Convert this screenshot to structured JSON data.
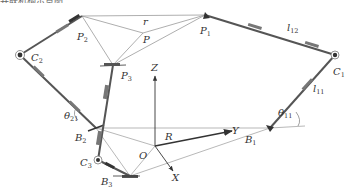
{
  "figure": {
    "caption_fragment": "并联机构示意图",
    "labels": {
      "r": "r",
      "P": "P",
      "P1": "P",
      "P1_sub": "1",
      "P2": "P",
      "P2_sub": "2",
      "P3": "P",
      "P3_sub": "3",
      "C1": "C",
      "C1_sub": "1",
      "C2": "C",
      "C2_sub": "2",
      "C3": "C",
      "C3_sub": "3",
      "B1": "B",
      "B1_sub": "1",
      "B2": "B",
      "B2_sub": "2",
      "B3": "B",
      "B3_sub": "3",
      "l12": "l",
      "l12_sub": "12",
      "l11": "l",
      "l11_sub": "11",
      "theta11": "θ",
      "theta11_sub": "11",
      "theta21": "θ",
      "theta21_sub": "21",
      "Z": "Z",
      "Y": "Y",
      "X": "X",
      "O": "O",
      "R": "R"
    },
    "colors": {
      "line": "#888888",
      "link": "#555555",
      "joint": "#333333",
      "text": "#333333"
    }
  }
}
